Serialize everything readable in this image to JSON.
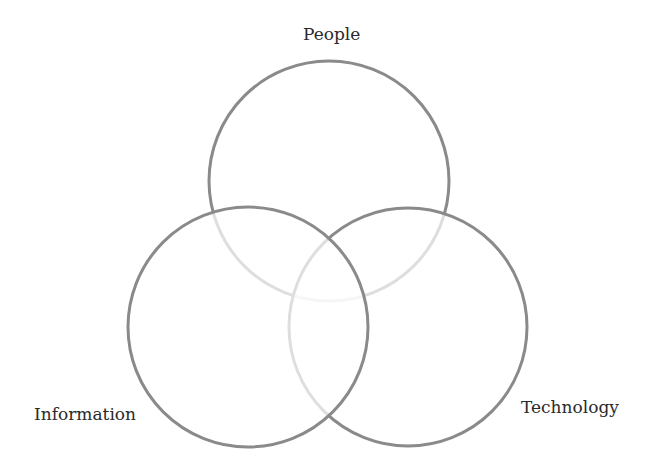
{
  "diagram": {
    "type": "venn",
    "sets": [
      {
        "id": "people",
        "label": "People",
        "cx": 329,
        "cy": 181,
        "r": 120
      },
      {
        "id": "technology",
        "label": "Technology",
        "cx": 408,
        "cy": 327,
        "r": 119
      },
      {
        "id": "information",
        "label": "Information",
        "cx": 248,
        "cy": 327,
        "r": 120
      }
    ],
    "colors": {
      "stroke": "#888888",
      "background": "#ffffff",
      "text": "#2a2a2a"
    }
  }
}
